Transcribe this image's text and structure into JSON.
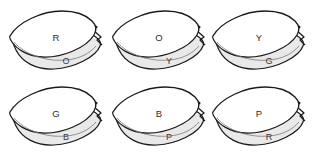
{
  "diagram": {
    "background_color": "#ffffff",
    "grid": {
      "rows": 2,
      "columns": 3
    },
    "style": {
      "outline_color": "#1a1a1a",
      "top_layer_fill": "#ffffff",
      "bottom_layer_fill": "#e9e9e9",
      "inner_line_color": "#6a6a6a",
      "label_color": "#2b2b2b"
    },
    "shapes": [
      {
        "id": "shape-1",
        "top_label": "R",
        "bottom_label": "O",
        "row": 1,
        "column": 1
      },
      {
        "id": "shape-2",
        "top_label": "O",
        "bottom_label": "Y",
        "row": 1,
        "column": 2
      },
      {
        "id": "shape-3",
        "top_label": "Y",
        "bottom_label": "G",
        "row": 1,
        "column": 3
      },
      {
        "id": "shape-4",
        "top_label": "G",
        "bottom_label": "B",
        "row": 2,
        "column": 1
      },
      {
        "id": "shape-5",
        "top_label": "B",
        "bottom_label": "P",
        "row": 2,
        "column": 2
      },
      {
        "id": "shape-6",
        "top_label": "P",
        "bottom_label": "R",
        "row": 2,
        "column": 3
      }
    ]
  }
}
